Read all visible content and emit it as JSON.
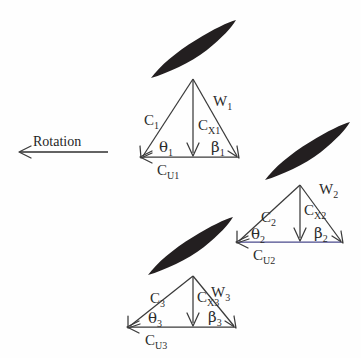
{
  "figure": {
    "background_color": "#fefefe",
    "ink_color": "#2b2b2b",
    "blade_color": "#231f20",
    "baseline_accent_color": "#4a4a8c",
    "width": 361,
    "height": 358
  },
  "rotation": {
    "label": "Rotation",
    "direction": "left",
    "arrow_name": "rotation-arrow"
  },
  "stations": [
    {
      "id": "station-1",
      "absolute_velocity": {
        "symbol": "C",
        "subscript": "1",
        "text": "C"
      },
      "relative_velocity": {
        "symbol": "W",
        "subscript": "1",
        "text": "W"
      },
      "axial_velocity": {
        "symbol": "C",
        "subscript": "X1",
        "text": "C"
      },
      "tangential_velocity": {
        "symbol": "C",
        "subscript": "U1",
        "text": "C"
      },
      "absolute_angle": {
        "symbol": "θ",
        "subscript": "1",
        "text": "θ"
      },
      "relative_angle": {
        "symbol": "β",
        "subscript": "1",
        "text": "β"
      }
    },
    {
      "id": "station-2",
      "absolute_velocity": {
        "symbol": "C",
        "subscript": "2",
        "text": "C"
      },
      "relative_velocity": {
        "symbol": "W",
        "subscript": "2",
        "text": "W"
      },
      "axial_velocity": {
        "symbol": "C",
        "subscript": "X2",
        "text": "C"
      },
      "tangential_velocity": {
        "symbol": "C",
        "subscript": "U2",
        "text": "C"
      },
      "absolute_angle": {
        "symbol": "θ",
        "subscript": "2",
        "text": "θ"
      },
      "relative_angle": {
        "symbol": "β",
        "subscript": "2",
        "text": "β"
      }
    },
    {
      "id": "station-3",
      "absolute_velocity": {
        "symbol": "C",
        "subscript": "3",
        "text": "C"
      },
      "relative_velocity": {
        "symbol": "W",
        "subscript": "3",
        "text": "W"
      },
      "axial_velocity": {
        "symbol": "C",
        "subscript": "X3",
        "text": "C"
      },
      "tangential_velocity": {
        "symbol": "C",
        "subscript": "U3",
        "text": "C"
      },
      "absolute_angle": {
        "symbol": "θ",
        "subscript": "3",
        "text": "θ"
      },
      "relative_angle": {
        "symbol": "β",
        "subscript": "3",
        "text": "β"
      }
    }
  ],
  "blades": [
    {
      "id": "blade-1",
      "name": "blade-upper"
    },
    {
      "id": "blade-2",
      "name": "blade-right"
    },
    {
      "id": "blade-3",
      "name": "blade-lower"
    }
  ]
}
